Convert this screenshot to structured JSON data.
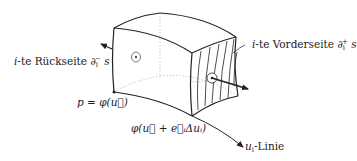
{
  "diagram": {
    "labels": {
      "back_face": {
        "prefix": "i",
        "text": "-te Rückseite ",
        "symbol": "∂",
        "sub": "i",
        "sup": "−",
        "suffix": " s"
      },
      "front_face": {
        "prefix": "i",
        "text": "-te Vorderseite ",
        "symbol": "∂",
        "sub": "i",
        "sup": "+",
        "suffix": " s"
      },
      "point_p": "p = φ(u⃗)",
      "point_shift": "φ(u⃗ + e⃗ᵢΔuᵢ)",
      "u_line": {
        "var": "u",
        "sub": "i",
        "text": "-Linie"
      }
    },
    "colors": {
      "stroke": "#222222",
      "hidden_edge": "#b0b0b0",
      "background": "#ffffff"
    }
  }
}
